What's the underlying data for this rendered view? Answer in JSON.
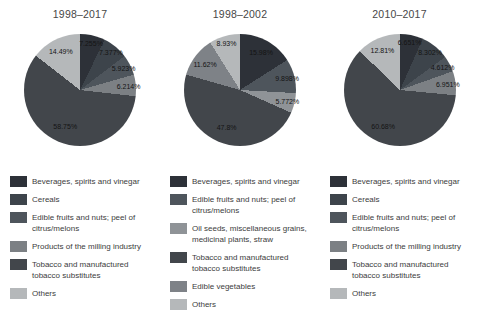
{
  "colors": {
    "beverages": "#2d3138",
    "cereals": "#3d444b",
    "edible_fruits": "#4e555c",
    "products_milling": "#7c8084",
    "tobacco": "#42464b",
    "others": "#b5b8ba",
    "oil_seeds": "#8f9397",
    "edible_vegetables": "#7e8287"
  },
  "chart_data": [
    {
      "type": "pie",
      "title": "1998–2017",
      "legend_position": "bottom",
      "slices": [
        {
          "label": "Beverages, spirits and vinegar",
          "value": 7.255,
          "display": "7.255%",
          "color_key": "beverages"
        },
        {
          "label": "Cereals",
          "value": 7.377,
          "display": "7.377%",
          "color_key": "cereals"
        },
        {
          "label": "Edible fruits and nuts; peel of citrus/melons",
          "value": 5.923,
          "display": "5.923%",
          "color_key": "edible_fruits"
        },
        {
          "label": "Products of the milling industry",
          "value": 6.214,
          "display": "6.214%",
          "color_key": "products_milling"
        },
        {
          "label": "Tobacco and manufactured tobacco substitutes",
          "value": 58.75,
          "display": "58.75%",
          "color_key": "tobacco"
        },
        {
          "label": "Others",
          "value": 14.49,
          "display": "14.49%",
          "color_key": "others"
        }
      ]
    },
    {
      "type": "pie",
      "title": "1998–2002",
      "legend_position": "bottom",
      "slices": [
        {
          "label": "Beverages, spirits and vinegar",
          "value": 15.98,
          "display": "15.98%",
          "color_key": "beverages"
        },
        {
          "label": "Edible fruits and nuts; peel of citrus/melons",
          "value": 9.898,
          "display": "9.898%",
          "color_key": "edible_fruits"
        },
        {
          "label": "Oil seeds, miscellaneous grains, medicinal plants, straw",
          "value": 5.772,
          "display": "5.772%",
          "color_key": "oil_seeds"
        },
        {
          "label": "Tobacco and manufactured tobacco substitutes",
          "value": 47.8,
          "display": "47.8%",
          "color_key": "tobacco"
        },
        {
          "label": "Edible vegetables",
          "value": 11.62,
          "display": "11.62%",
          "color_key": "edible_vegetables"
        },
        {
          "label": "Others",
          "value": 8.93,
          "display": "8.93%",
          "color_key": "others"
        }
      ]
    },
    {
      "type": "pie",
      "title": "2010–2017",
      "legend_position": "bottom",
      "slices": [
        {
          "label": "Beverages, spirits and vinegar",
          "value": 6.651,
          "display": "6.651%",
          "color_key": "beverages"
        },
        {
          "label": "Cereals",
          "value": 8.302,
          "display": "8.302%",
          "color_key": "cereals"
        },
        {
          "label": "Edible fruits and nuts; peel of citrus/melons",
          "value": 4.612,
          "display": "4.612%",
          "color_key": "edible_fruits"
        },
        {
          "label": "Products of the milling industry",
          "value": 6.951,
          "display": "6.951%",
          "color_key": "products_milling"
        },
        {
          "label": "Tobacco and manufactured tobacco substitutes",
          "value": 60.68,
          "display": "60.68%",
          "color_key": "tobacco"
        },
        {
          "label": "Others",
          "value": 12.81,
          "display": "12.81%",
          "color_key": "others"
        }
      ]
    }
  ]
}
